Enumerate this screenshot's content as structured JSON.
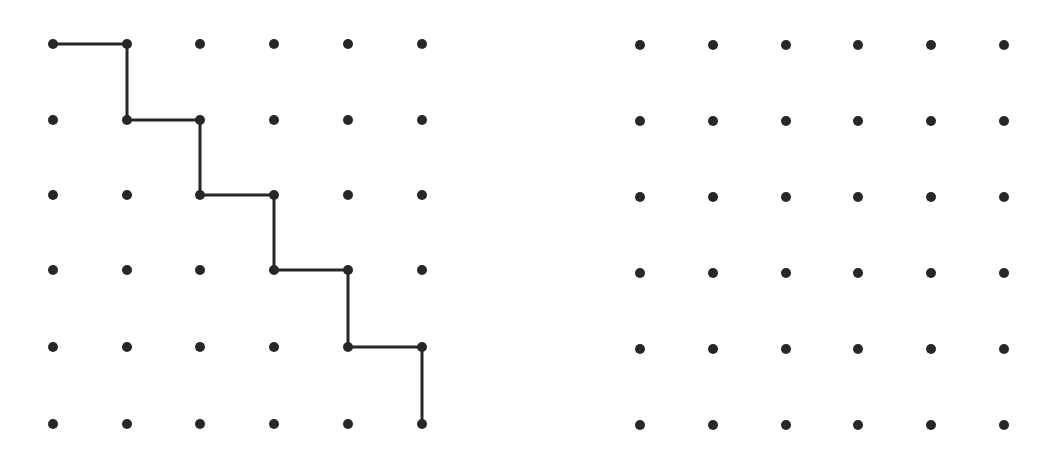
{
  "figure": {
    "background": "#ffffff",
    "ink_color": "#2a2526",
    "dot_radius": 5,
    "line_width": 3
  },
  "grids": [
    {
      "name": "left-grid",
      "rows": 6,
      "cols": 6,
      "x_positions": [
        53,
        127,
        200,
        274,
        348,
        422
      ],
      "y_positions": [
        44,
        120,
        195,
        270,
        347,
        424
      ],
      "staircase_path": [
        [
          0,
          0
        ],
        [
          1,
          0
        ],
        [
          1,
          1
        ],
        [
          2,
          1
        ],
        [
          2,
          2
        ],
        [
          3,
          2
        ],
        [
          3,
          3
        ],
        [
          4,
          3
        ],
        [
          4,
          4
        ],
        [
          5,
          4
        ],
        [
          5,
          5
        ]
      ]
    },
    {
      "name": "right-grid",
      "rows": 6,
      "cols": 6,
      "x_positions": [
        640,
        713,
        786,
        858,
        931,
        1004
      ],
      "y_positions": [
        45,
        121,
        197,
        273,
        349,
        425
      ],
      "staircase_path": []
    }
  ]
}
